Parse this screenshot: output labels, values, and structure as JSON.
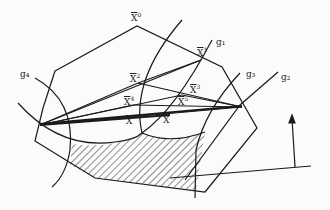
{
  "diagram": {
    "labels": {
      "x0": {
        "base": "X",
        "sup": "0"
      },
      "x1": {
        "base": "X",
        "sup": "1"
      },
      "x2": {
        "base": "X",
        "sup": "2"
      },
      "x3": {
        "base": "X",
        "sup": "3"
      },
      "x4": {
        "base": "X",
        "sup": "4"
      },
      "x5": {
        "base": "X",
        "sup": "5"
      },
      "xa": {
        "base": "X"
      },
      "xb": {
        "base": "X"
      },
      "g1": "g₁",
      "g2": "g₂",
      "g3": "g₃",
      "g4": "g₄"
    },
    "colors": {
      "stroke": "#1a1a1a",
      "background": "#fbfbfb"
    }
  }
}
